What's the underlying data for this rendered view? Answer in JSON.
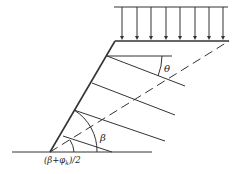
{
  "diagram": {
    "type": "slope-stability-schematic",
    "labels": {
      "theta": "θ",
      "beta": "β",
      "half_angle": "(β+φ",
      "half_angle_sub": "k",
      "half_angle_tail": ")/2"
    },
    "load": {
      "arrow_count": 8
    },
    "slip_lines": 4
  }
}
